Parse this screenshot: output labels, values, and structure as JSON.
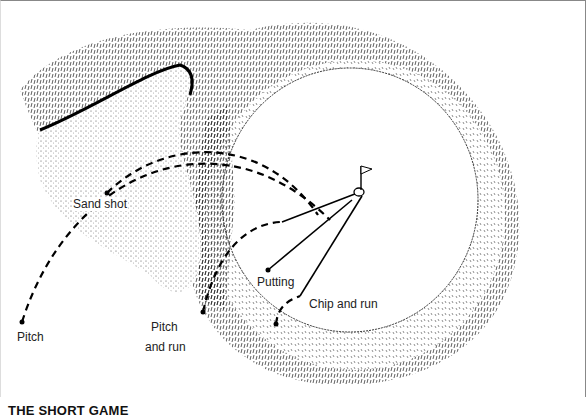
{
  "diagram": {
    "title": "THE SHORT GAME",
    "labels": {
      "pitch": "Pitch",
      "sand_shot": "Sand shot",
      "pitch_and_run_1": "Pitch",
      "pitch_and_run_2": "and run",
      "putting": "Putting",
      "chip_and_run": "Chip and run"
    },
    "elements": [
      "rough",
      "fairway-fringe",
      "green",
      "bunker",
      "flag",
      "hole"
    ]
  }
}
